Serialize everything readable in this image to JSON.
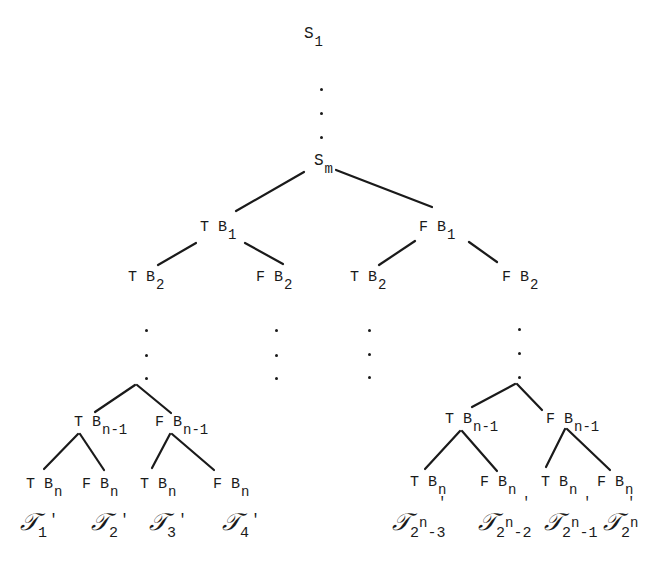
{
  "diagram": {
    "type": "binary-decision-tree",
    "root_chain": {
      "top": {
        "label": "S",
        "sub": "1"
      },
      "ellipsis": "⋮",
      "bottom": {
        "label": "S",
        "sub": "m"
      }
    },
    "level1": [
      {
        "prefix": "T",
        "label": "B",
        "sub": "1"
      },
      {
        "prefix": "F",
        "label": "B",
        "sub": "1"
      }
    ],
    "level2": [
      {
        "prefix": "T",
        "label": "B",
        "sub": "2"
      },
      {
        "prefix": "F",
        "label": "B",
        "sub": "2"
      },
      {
        "prefix": "T",
        "label": "B",
        "sub": "2"
      },
      {
        "prefix": "F",
        "label": "B",
        "sub": "2"
      }
    ],
    "level_n_minus_1": [
      {
        "prefix": "T",
        "label": "B",
        "sub": "n-1"
      },
      {
        "prefix": "F",
        "label": "B",
        "sub": "n-1"
      },
      {
        "prefix": "T",
        "label": "B",
        "sub": "n-1"
      },
      {
        "prefix": "F",
        "label": "B",
        "sub": "n-1"
      }
    ],
    "level_n": [
      {
        "prefix": "T",
        "label": "B",
        "sub": "n"
      },
      {
        "prefix": "F",
        "label": "B",
        "sub": "n"
      },
      {
        "prefix": "T",
        "label": "B",
        "sub": "n"
      },
      {
        "prefix": "F",
        "label": "B",
        "sub": "n"
      },
      {
        "prefix": "T",
        "label": "B",
        "sub": "n"
      },
      {
        "prefix": "F",
        "label": "B",
        "sub": "n"
      },
      {
        "prefix": "T",
        "label": "B",
        "sub": "n"
      },
      {
        "prefix": "F",
        "label": "B",
        "sub": "n"
      }
    ],
    "leaves": [
      {
        "symbol": "𝒯",
        "sub": "1",
        "sup": "",
        "tail": "",
        "prime": "'"
      },
      {
        "symbol": "𝒯",
        "sub": "2",
        "sup": "",
        "tail": "",
        "prime": "'"
      },
      {
        "symbol": "𝒯",
        "sub": "3",
        "sup": "",
        "tail": "",
        "prime": "'"
      },
      {
        "symbol": "𝒯",
        "sub": "4",
        "sup": "",
        "tail": "",
        "prime": "'"
      },
      {
        "symbol": "𝒯",
        "sub": "2",
        "sup": "n",
        "tail": "-3",
        "prime": "'"
      },
      {
        "symbol": "𝒯",
        "sub": "2",
        "sup": "n",
        "tail": "-2",
        "prime": "'"
      },
      {
        "symbol": "𝒯",
        "sub": "2",
        "sup": "n",
        "tail": "-1",
        "prime": "'"
      },
      {
        "symbol": "𝒯",
        "sub": "2",
        "sup": "n",
        "tail": "",
        "prime": "'"
      }
    ],
    "colors": {
      "ink": "#1a1a1a",
      "background": "#ffffff"
    }
  }
}
